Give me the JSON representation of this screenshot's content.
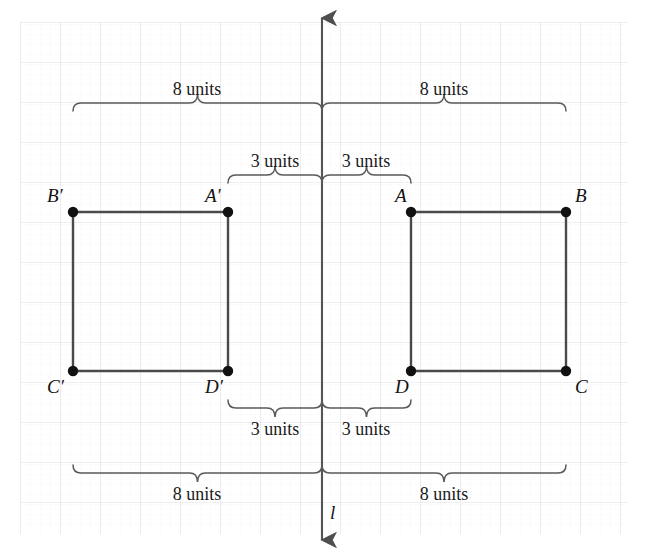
{
  "figure": {
    "width": 647,
    "height": 554,
    "background_color": "#ffffff",
    "grid": {
      "visible": true,
      "minor_spacing": 10,
      "major_spacing": 40,
      "origin_x": 20,
      "origin_y": 22,
      "minor_color": "#eceaee",
      "major_color": "#e3e1e6"
    }
  },
  "line_of_reflection": {
    "name": "l",
    "label": "l",
    "x": 322,
    "y_top": 18,
    "y_bottom": 540,
    "color": "#555555",
    "label_x": 330,
    "label_y": 503
  },
  "shapes": {
    "stroke_color": "#4a4a4a",
    "point_color": "#111111",
    "preimage": {
      "name": "ABCD",
      "vertices": [
        {
          "label": "A",
          "x": 411,
          "y": 212,
          "label_dx": -16,
          "label_dy": -26
        },
        {
          "label": "B",
          "x": 566,
          "y": 212,
          "label_dx": 9,
          "label_dy": -26
        },
        {
          "label": "C",
          "x": 566,
          "y": 371,
          "label_dx": 9,
          "label_dy": 6
        },
        {
          "label": "D",
          "x": 411,
          "y": 371,
          "label_dx": -16,
          "label_dy": 6
        }
      ]
    },
    "image": {
      "name": "A'B'C'D'",
      "vertices": [
        {
          "label": "A′",
          "x": 228,
          "y": 212,
          "label_dx": -23,
          "label_dy": -26
        },
        {
          "label": "B′",
          "x": 73,
          "y": 212,
          "label_dx": -26,
          "label_dy": -26
        },
        {
          "label": "C′",
          "x": 73,
          "y": 371,
          "label_dx": -26,
          "label_dy": 6
        },
        {
          "label": "D′",
          "x": 228,
          "y": 371,
          "label_dx": -23,
          "label_dy": 6
        }
      ]
    }
  },
  "measurements": [
    {
      "id": "top-left-8",
      "text": "8 units",
      "value": 8,
      "unit": "units",
      "x1": 73,
      "x2": 322,
      "brace_y": 103,
      "direction": "up",
      "text_x": 197,
      "text_y": 80
    },
    {
      "id": "top-right-8",
      "text": "8 units",
      "value": 8,
      "unit": "units",
      "x1": 322,
      "x2": 566,
      "brace_y": 103,
      "direction": "up",
      "text_x": 444,
      "text_y": 80
    },
    {
      "id": "top-left-3",
      "text": "3 units",
      "value": 3,
      "unit": "units",
      "x1": 228,
      "x2": 322,
      "brace_y": 175,
      "direction": "up",
      "text_x": 275,
      "text_y": 152
    },
    {
      "id": "top-right-3",
      "text": "3 units",
      "value": 3,
      "unit": "units",
      "x1": 322,
      "x2": 411,
      "brace_y": 175,
      "direction": "up",
      "text_x": 366,
      "text_y": 152
    },
    {
      "id": "bottom-left-3",
      "text": "3 units",
      "value": 3,
      "unit": "units",
      "x1": 228,
      "x2": 322,
      "brace_y": 408,
      "direction": "down",
      "text_x": 275,
      "text_y": 420
    },
    {
      "id": "bottom-right-3",
      "text": "3 units",
      "value": 3,
      "unit": "units",
      "x1": 322,
      "x2": 411,
      "brace_y": 408,
      "direction": "down",
      "text_x": 366,
      "text_y": 420
    },
    {
      "id": "bottom-left-8",
      "text": "8 units",
      "value": 8,
      "unit": "units",
      "x1": 73,
      "x2": 322,
      "brace_y": 473,
      "direction": "down",
      "text_x": 197,
      "text_y": 485
    },
    {
      "id": "bottom-right-8",
      "text": "8 units",
      "value": 8,
      "unit": "units",
      "x1": 322,
      "x2": 566,
      "brace_y": 473,
      "direction": "down",
      "text_x": 444,
      "text_y": 485
    }
  ]
}
